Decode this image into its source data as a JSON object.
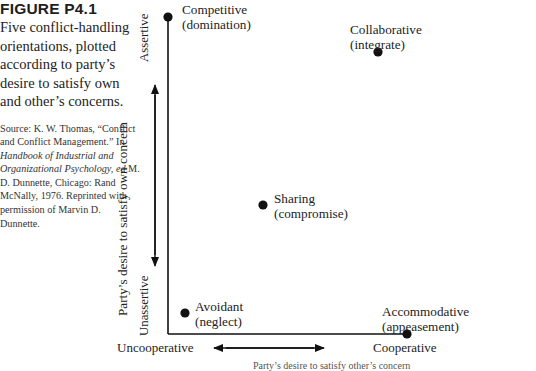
{
  "caption": {
    "figure_number": "FIGURE P4.1",
    "description": "Five conflict-handling orientations, plotted according to party’s desire to satisfy own and other’s concerns.",
    "source_prefix": "Source: K. W. Thomas, “Conflict and Conflict Management.” In ",
    "source_book": "Handbook of Industrial and Organizational Psychology,",
    "source_ed": " ed",
    "source_rest": " M. D. Dunnette, Chicago: Rand McNally, 1976. Reprinted with permission of Marvin D. Dunnette."
  },
  "axes": {
    "y_axis_label": "Party’s desire to satisfy own concern",
    "y_high": "Assertive",
    "y_low": "Unassertive",
    "x_low": "Uncooperative",
    "x_high": "Cooperative",
    "x_axis_label": "Party’s desire to satisfy other’s concern"
  },
  "points": [
    {
      "line1": "Competitive",
      "line2": "(domination)"
    },
    {
      "line1": "Collaborative",
      "line2": "(integrate)"
    },
    {
      "line1": "Sharing",
      "line2": "(compromise)"
    },
    {
      "line1": "Avoidant",
      "line2": "(neglect)"
    },
    {
      "line1": "Accommodative",
      "line2": "(appeasement)"
    }
  ],
  "colors": {
    "ink": "#111111",
    "text": "#222222",
    "background": "#ffffff"
  }
}
